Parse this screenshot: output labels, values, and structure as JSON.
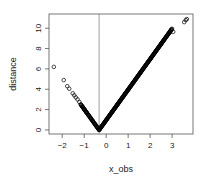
{
  "chart_data": {
    "type": "scatter",
    "title": "",
    "xlabel": "x_obs",
    "ylabel": "distance",
    "xlim": [
      -2.6,
      3.95
    ],
    "ylim": [
      -0.4,
      11.4
    ],
    "x_ticks": [
      -2,
      -1,
      0,
      1,
      2,
      3
    ],
    "y_ticks": [
      0,
      2,
      4,
      6,
      8,
      10
    ],
    "vline": -0.32,
    "grid": false,
    "legend": null,
    "marker": "open-circle",
    "series": [
      {
        "name": "distance vs x_obs",
        "description": "distance = |x_obs - (-0.32)| * ~3.0; V-shaped, sparse on left tail, dense band from vertex to right",
        "points": [
          [
            -2.38,
            6.2
          ],
          [
            -1.93,
            4.9
          ],
          [
            -1.77,
            4.3
          ],
          [
            -1.68,
            4.05
          ],
          [
            -1.52,
            3.6
          ],
          [
            -1.45,
            3.4
          ],
          [
            -1.38,
            3.2
          ],
          [
            -1.3,
            3.0
          ],
          [
            -1.22,
            2.75
          ],
          [
            -1.15,
            2.5
          ],
          [
            -1.08,
            2.3
          ],
          [
            -1.0,
            2.05
          ],
          [
            -0.9,
            1.75
          ],
          [
            -0.8,
            1.45
          ],
          [
            -0.7,
            1.15
          ],
          [
            -0.6,
            0.85
          ],
          [
            -0.5,
            0.55
          ],
          [
            -0.4,
            0.25
          ],
          [
            -0.32,
            0.0
          ],
          [
            0.0,
            0.95
          ],
          [
            0.5,
            2.45
          ],
          [
            1.0,
            3.95
          ],
          [
            1.5,
            5.45
          ],
          [
            2.0,
            6.95
          ],
          [
            2.5,
            8.45
          ],
          [
            2.9,
            9.6
          ],
          [
            3.05,
            9.65
          ],
          [
            3.55,
            10.6
          ],
          [
            3.62,
            10.8
          ],
          [
            3.67,
            10.9
          ]
        ]
      }
    ]
  }
}
